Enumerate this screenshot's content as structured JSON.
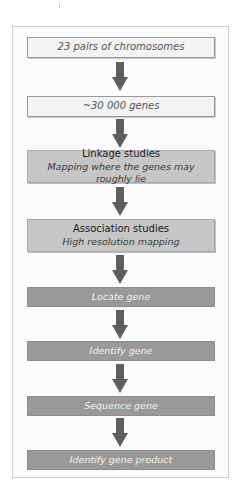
{
  "diagram": {
    "type": "flowchart",
    "direction": "top-to-bottom",
    "colors": {
      "frame_border": "#cfcfcf",
      "light_box": "#f3f3f3",
      "mid_box": "#c6c6c6",
      "dark_box": "#999999",
      "arrow": "#5e5e5e"
    },
    "steps": [
      {
        "label": "23 pairs of chromosomes",
        "style": "light"
      },
      {
        "label": "~30 000 genes",
        "style": "light"
      },
      {
        "title": "Linkage studies",
        "subtitle": "Mapping where the genes may roughly lie",
        "style": "mid"
      },
      {
        "title": "Association studies",
        "subtitle": "High resolution mapping",
        "style": "mid"
      },
      {
        "label": "Locate gene",
        "style": "dark"
      },
      {
        "label": "Identify gene",
        "style": "dark"
      },
      {
        "label": "Sequence gene",
        "style": "dark"
      },
      {
        "label": "Identify gene product",
        "style": "dark"
      }
    ],
    "arrows": [
      {
        "from": 0,
        "to": 1
      },
      {
        "from": 1,
        "to": 2
      },
      {
        "from": 2,
        "to": 3
      },
      {
        "from": 3,
        "to": 4
      },
      {
        "from": 4,
        "to": 5
      },
      {
        "from": 5,
        "to": 6
      },
      {
        "from": 6,
        "to": 7
      }
    ]
  }
}
